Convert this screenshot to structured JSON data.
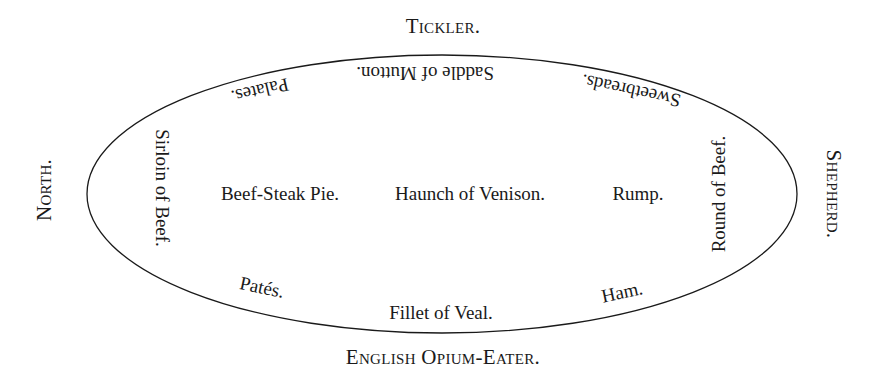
{
  "seats": {
    "top": "Tickler.",
    "left": "North.",
    "right": "Shepherd.",
    "bottom": "English Opium-Eater."
  },
  "dishes": {
    "top_center": "Saddle of Mutton.",
    "top_left": "Palates.",
    "top_right": "Sweetbreads.",
    "left": "Sirloin of Beef.",
    "right": "Round of Beef.",
    "center_left": "Beef-Steak Pie.",
    "center": "Haunch of Venison.",
    "center_right": "Rump.",
    "bottom_left": "Patés.",
    "bottom_center": "Fillet of Veal.",
    "bottom_right": "Ham."
  },
  "colors": {
    "ink": "#1a1a1a",
    "background": "#ffffff"
  }
}
